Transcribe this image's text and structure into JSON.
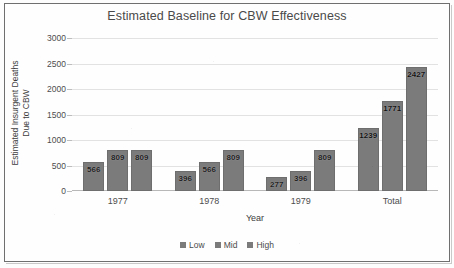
{
  "chart_data": {
    "type": "bar",
    "title": "Estimated Baseline for CBW Effectiveness",
    "xlabel": "Year",
    "ylabel": "Estimated Insurgent Deaths",
    "ylabel_line2": "Due to CBW",
    "categories": [
      "1977",
      "1978",
      "1979",
      "Total"
    ],
    "series": [
      {
        "name": "Low",
        "values": [
          566,
          396,
          277,
          1239
        ]
      },
      {
        "name": "Mid",
        "values": [
          809,
          566,
          396,
          1771
        ]
      },
      {
        "name": "High",
        "values": [
          809,
          809,
          809,
          2427
        ]
      }
    ],
    "ylim": [
      0,
      3000
    ],
    "ytick_labels": [
      "3000",
      "2500",
      "2000",
      "1500",
      "1000",
      "500",
      "0"
    ],
    "ytick_values": [
      3000,
      2500,
      2000,
      1500,
      1000,
      500,
      0
    ],
    "grid": true,
    "legend_position": "bottom",
    "bar_color": "#7b7b7b",
    "grid_color": "#e2e2e2",
    "axis_color": "#b8b8b8",
    "text_color": "#4a4a4a",
    "data_labels": [
      [
        "566",
        "809",
        "809"
      ],
      [
        "396",
        "566",
        "809"
      ],
      [
        "277",
        "396",
        "809"
      ],
      [
        "1239",
        "1771",
        "2427"
      ]
    ]
  }
}
